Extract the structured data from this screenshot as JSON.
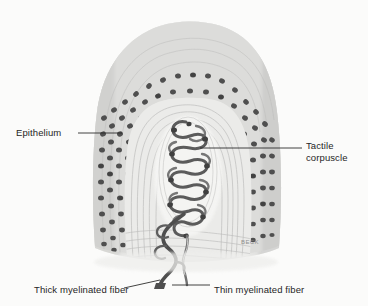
{
  "figure": {
    "background_color": "#fbfbfa",
    "ink_color": "#262626",
    "signature": "BECK"
  },
  "labels": {
    "epithelium": "Epithelium",
    "tactile_line1": "Tactile",
    "tactile_line2": "corpuscle",
    "thick_fiber": "Thick myelinated fiber",
    "thin_fiber": "Thin myelinated fiber"
  },
  "structures": {
    "epithelium_name": "epithelium",
    "corpuscle_name": "tactile-corpuscle",
    "thick_fiber_name": "thick-myelinated-fiber",
    "thin_fiber_name": "thin-myelinated-fiber",
    "connective_tissue_name": "connective-tissue"
  },
  "palette": {
    "nucleus_dark": "#4a4a4a",
    "nucleus_mid": "#6a6a6a",
    "cell_light": "#d9d9d9",
    "capsule_pale": "#f0f0ee",
    "fiber_dark": "#555555",
    "tissue_gray": "#c9c9c9",
    "leader_line": "#2d2d2d"
  }
}
